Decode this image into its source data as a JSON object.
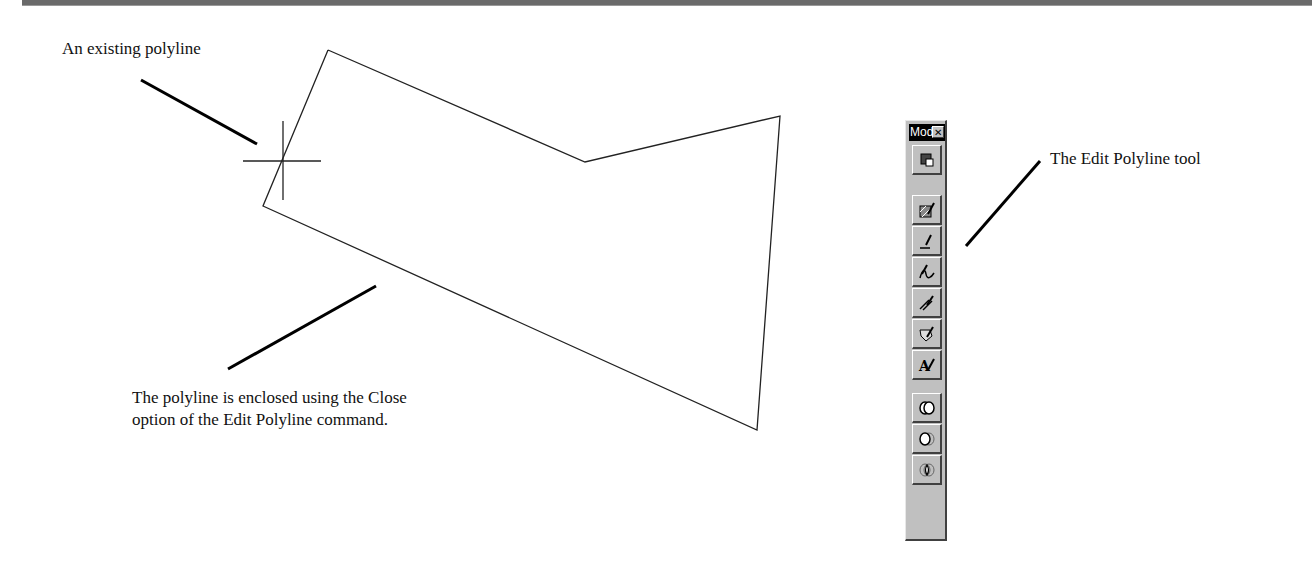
{
  "annotations": {
    "existing_polyline": "An existing polyline",
    "enclosed_line1": "The polyline is enclosed using the Close",
    "enclosed_line2": "option of the Edit Polyline command.",
    "edit_polyline_tool": "The Edit Polyline tool"
  },
  "toolbar": {
    "title": "Mod",
    "close_glyph": "✕",
    "buttons": [
      {
        "name": "properties",
        "icon": "properties-icon"
      },
      {
        "name": "edit-hatch",
        "icon": "edit-hatch-icon"
      },
      {
        "name": "edit-polyline",
        "icon": "edit-polyline-icon"
      },
      {
        "name": "edit-spline",
        "icon": "edit-spline-icon"
      },
      {
        "name": "edit-multiline",
        "icon": "edit-multiline-icon"
      },
      {
        "name": "edit-attribute",
        "icon": "edit-attribute-icon"
      },
      {
        "name": "edit-text",
        "icon": "edit-text-icon"
      },
      {
        "name": "union",
        "icon": "union-icon"
      },
      {
        "name": "subtract",
        "icon": "subtract-icon"
      },
      {
        "name": "intersect",
        "icon": "intersect-icon"
      }
    ]
  },
  "colors": {
    "toolbar_face": "#c0c0c0",
    "title_bar": "#000000",
    "ink": "#111111"
  }
}
